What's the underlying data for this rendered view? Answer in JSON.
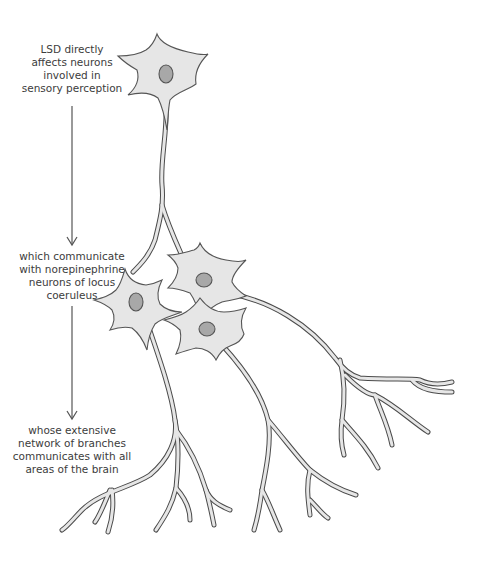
{
  "diagram": {
    "colors": {
      "background": "#ffffff",
      "cell_body": "#e6e6e6",
      "nucleus": "#a8a8a8",
      "outline": "#555555",
      "text": "#3c3c3c"
    },
    "captions": [
      {
        "id": "step-1",
        "lines": [
          "LSD directly",
          "affects neurons",
          "involved in",
          "sensory perception"
        ]
      },
      {
        "id": "step-2",
        "lines": [
          "which communicate",
          "with norepinephrine",
          "neurons of locus",
          "coeruleus"
        ]
      },
      {
        "id": "step-3",
        "lines": [
          "whose extensive",
          "network of branches",
          "communicates with all",
          "areas of the brain"
        ]
      }
    ],
    "arrows": [
      {
        "from": "step-1",
        "to": "step-2",
        "direction": "down"
      },
      {
        "from": "step-2",
        "to": "step-3",
        "direction": "down"
      }
    ],
    "neurons": [
      {
        "id": "sensory-neuron",
        "label": "sensory perception neuron"
      },
      {
        "id": "lc-neuron-1",
        "label": "locus coeruleus neuron"
      },
      {
        "id": "lc-neuron-2",
        "label": "locus coeruleus neuron"
      },
      {
        "id": "lc-neuron-3",
        "label": "locus coeruleus neuron"
      }
    ]
  }
}
